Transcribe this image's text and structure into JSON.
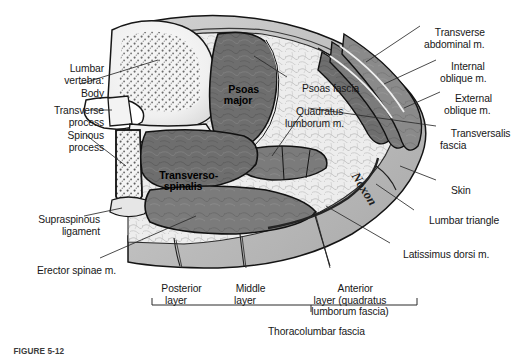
{
  "figure": {
    "caption": "FIGURE 5-12",
    "signature": "Noxon",
    "colors": {
      "background": "#ffffff",
      "muscle_dark": "#6e6e6e",
      "muscle_mid": "#7d7d7d",
      "muscle_light": "#8b8b8b",
      "bone": "#f2f2f2",
      "bone_stipple": "#6b6b6b",
      "fat": "#ececec",
      "fascia": "#cfcfcf",
      "skin": "#bdbdbd",
      "outline": "#1a1a1a",
      "leader": "#2a2a2a",
      "text": "#171717"
    }
  },
  "labels_left": [
    {
      "id": "lumbar-vertebra",
      "text": "Lumbar\nvertebra:",
      "x": 18,
      "y": 58
    },
    {
      "id": "body",
      "text": "Body",
      "x": 44,
      "y": 83
    },
    {
      "id": "transverse-process",
      "text": "Transverse\nprocess",
      "x": 27,
      "y": 99
    },
    {
      "id": "spinous-process",
      "text": "Spinous\nprocess",
      "x": 36,
      "y": 124
    },
    {
      "id": "supraspinous-ligament",
      "text": "Supraspinous\nligament",
      "x": 13,
      "y": 208
    },
    {
      "id": "erector-spinae",
      "text": "Erector spinae m.",
      "x": 13,
      "y": 259
    }
  ],
  "labels_right": [
    {
      "id": "transverse-abdominal",
      "text": "Transverse\nabdominal m.",
      "x": 424,
      "y": 17
    },
    {
      "id": "internal-oblique",
      "text": "Internal\noblique m.",
      "x": 440,
      "y": 52
    },
    {
      "id": "external-oblique",
      "text": "External\noblique m.",
      "x": 444,
      "y": 84
    },
    {
      "id": "transversalis-fascia",
      "text": "Transversalis\nfascia",
      "x": 440,
      "y": 119
    },
    {
      "id": "skin",
      "text": "Skin",
      "x": 440,
      "y": 176
    },
    {
      "id": "lumbar-triangle",
      "text": "Lumbar triangle",
      "x": 418,
      "y": 205
    },
    {
      "id": "latissimus-dorsi",
      "text": "Latissimus dorsi m.",
      "x": 393,
      "y": 239
    }
  ],
  "labels_center": [
    {
      "id": "psoas-fascia",
      "text": "Psoas fascia",
      "x": 291,
      "y": 72
    },
    {
      "id": "quadratus-lumborum",
      "text": "Quadratus\nlumborum m.",
      "x": 285,
      "y": 97
    }
  ],
  "labels_infigure": [
    {
      "id": "psoas-major",
      "text": "Psoas\nmajor",
      "x": 210,
      "y": 76
    },
    {
      "id": "transverso-spinalis",
      "text": "Transverso-\nspinalis",
      "x": 148,
      "y": 162
    }
  ],
  "labels_bottom": [
    {
      "id": "posterior-layer",
      "text": "Posterior\nlayer",
      "x": 163,
      "y": 274
    },
    {
      "id": "middle-layer",
      "text": "Middle\nlayer",
      "x": 229,
      "y": 274
    },
    {
      "id": "anterior-layer",
      "text": "Anterior\nlayer (quadratus\nlumborum fascia)",
      "x": 296,
      "y": 274
    }
  ],
  "bracket": {
    "label": "Thoracolumbar fascia",
    "label_x": 225,
    "label_y": 321,
    "x_left": 152,
    "x_right": 417,
    "y": 305,
    "tick_height": 7,
    "stem_x": 311
  }
}
